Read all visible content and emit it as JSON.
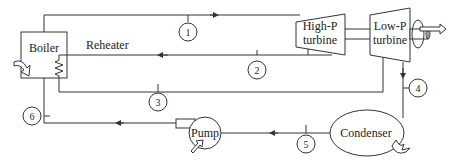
{
  "components": {
    "boiler": "Boiler",
    "reheater": "Reheater",
    "high_p_turbine": [
      "High-P",
      "turbine"
    ],
    "low_p_turbine": [
      "Low-P",
      "turbine"
    ],
    "condenser": "Condenser",
    "pump": "Pump"
  },
  "states": [
    "1",
    "2",
    "3",
    "4",
    "5",
    "6"
  ],
  "colors": {
    "line": "#333333",
    "background": "#ffffff"
  }
}
